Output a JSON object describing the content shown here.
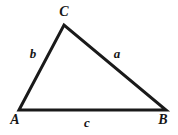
{
  "figure": {
    "type": "geometry-diagram",
    "shape": "triangle",
    "background_color": "#ffffff",
    "stroke_color": "#1a1a1a",
    "stroke_width": 3,
    "width": 178,
    "height": 135
  },
  "vertices": [
    {
      "id": "A",
      "label": "A",
      "x": 19,
      "y": 110
    },
    {
      "id": "B",
      "label": "B",
      "x": 166,
      "y": 110
    },
    {
      "id": "C",
      "label": "C",
      "x": 64,
      "y": 25
    }
  ],
  "sides": [
    {
      "id": "a",
      "label": "a",
      "from": "C",
      "to": "B",
      "opposite_vertex": "A"
    },
    {
      "id": "b",
      "label": "b",
      "from": "A",
      "to": "C",
      "opposite_vertex": "B"
    },
    {
      "id": "c",
      "label": "c",
      "from": "A",
      "to": "B",
      "opposite_vertex": "C"
    }
  ],
  "polygon_points": "19,110 64,25 166,110"
}
